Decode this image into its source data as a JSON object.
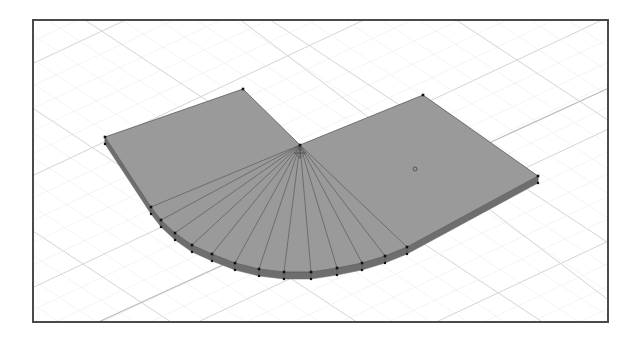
{
  "viewport": {
    "background": "#ffffff",
    "frame_color": "#4a4a4a",
    "grid": {
      "minor_color": "#ececec",
      "major_color": "#d4d4d4",
      "axis_color": "#bdbdbd"
    },
    "mesh": {
      "name": "rounded-L-slab",
      "top_face_color": "#9a9a9a",
      "side_face_color": "#6e6e6e",
      "edge_color": "#5a5a5a",
      "vertex_color": "#111111",
      "thickness_px": 7,
      "corners": {
        "back_left": [
          103,
          135
        ],
        "top_left": [
          241,
          87
        ],
        "pivot": [
          298,
          143
        ],
        "top_right": [
          421,
          93
        ],
        "right": [
          536,
          174
        ]
      },
      "arc_vertices": [
        [
          149,
          205
        ],
        [
          159,
          218
        ],
        [
          173,
          231
        ],
        [
          190,
          243
        ],
        [
          210,
          252
        ],
        [
          233,
          261
        ],
        [
          257,
          267
        ],
        [
          282,
          270
        ],
        [
          309,
          270
        ],
        [
          335,
          266
        ],
        [
          360,
          261
        ],
        [
          383,
          254
        ],
        [
          405,
          245
        ]
      ]
    },
    "origin_marker": "object-origin-icon",
    "cursor_marker": "3d-cursor-icon"
  }
}
